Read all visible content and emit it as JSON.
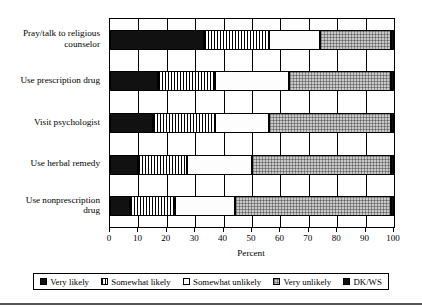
{
  "chart_data": {
    "type": "bar",
    "orientation": "horizontal",
    "stacked": true,
    "title": "",
    "xlabel": "Percent",
    "ylabel": "",
    "xlim": [
      0,
      100
    ],
    "xticks": [
      0,
      10,
      20,
      30,
      40,
      50,
      60,
      70,
      80,
      90,
      100
    ],
    "grid": true,
    "legend_position": "bottom",
    "categories": [
      "Pray/talk to religious counselor",
      "Use prescription drug",
      "Visit psychologist",
      "Use herbal remedy",
      "Use nonprescription drug"
    ],
    "series": [
      {
        "name": "Very likely",
        "pattern": "solid-black",
        "values": [
          33,
          17,
          15,
          10,
          7
        ]
      },
      {
        "name": "Somewhat likely",
        "pattern": "vertical",
        "values": [
          23,
          20,
          22,
          17,
          16
        ]
      },
      {
        "name": "Somewhat unlikely",
        "pattern": "white",
        "values": [
          18,
          26,
          19,
          23,
          21
        ]
      },
      {
        "name": "Very unlikely",
        "pattern": "gray-dots",
        "values": [
          25,
          36,
          43,
          49,
          55
        ]
      },
      {
        "name": "DK/WS",
        "pattern": "solid-black",
        "values": [
          1,
          1,
          1,
          1,
          1
        ]
      }
    ]
  },
  "axis": {
    "x_title": "Percent",
    "tick_labels": [
      "0",
      "10",
      "20",
      "30",
      "40",
      "50",
      "60",
      "70",
      "80",
      "90",
      "100"
    ]
  },
  "categories": {
    "items": [
      {
        "line1": "Pray/talk to religious",
        "line2": "counselor"
      },
      {
        "line1": "Use prescription drug",
        "line2": ""
      },
      {
        "line1": "Visit psychologist",
        "line2": ""
      },
      {
        "line1": "Use herbal remedy",
        "line2": ""
      },
      {
        "line1": "Use nonprescription",
        "line2": "drug"
      }
    ]
  },
  "legend": {
    "items": [
      {
        "label": "Very likely",
        "pattern": "solid-black"
      },
      {
        "label": "Somewhat likely",
        "pattern": "vertical"
      },
      {
        "label": "Somewhat unlikely",
        "pattern": "white"
      },
      {
        "label": "Very unlikely",
        "pattern": "gray-dots"
      },
      {
        "label": "DK/WS",
        "pattern": "solid-black"
      }
    ]
  },
  "colors": {
    "ink": "#000000",
    "background": "#ffffff",
    "gray_fill": "#c9c9c9",
    "black_fill": "#111111"
  }
}
